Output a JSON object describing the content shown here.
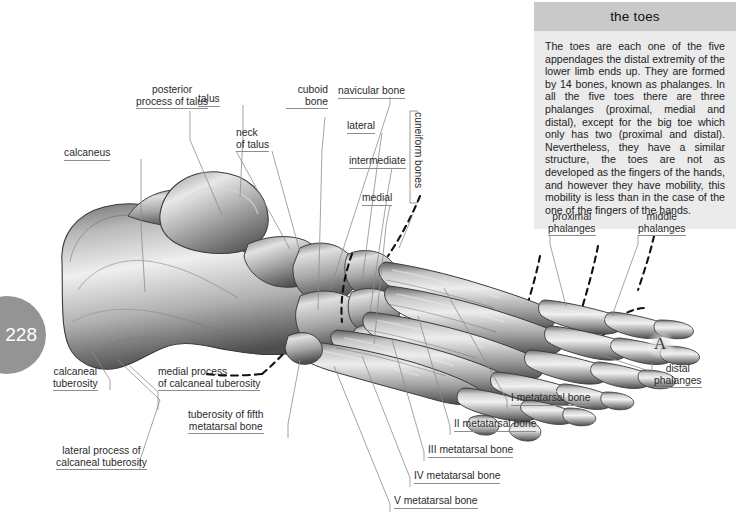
{
  "page": {
    "number": "228",
    "background_color": "#ffffff",
    "badge_color": "#949494"
  },
  "panel": {
    "title": "the toes",
    "title_bg": "#c9c9c9",
    "body_bg": "#ebebeb",
    "body": "The toes are each one of the five appendages the distal extremity of the lower limb ends up. They are formed by 14 bones, known as phalanges. In all the five toes there are three phalanges (proximal, medial and distal), except for the big toe which only has two (proximal and distal). Nevertheless, they have a similar structure, the toes are not as developed as the fingers of the hands, and however they have mobility, this mobility is less than in the case of the one of the fingers of the hands."
  },
  "figure": {
    "marker": "A",
    "bone_fill_light": "#efefef",
    "bone_fill_mid": "#9a9a9a",
    "bone_fill_dark": "#4c4c4c",
    "dashed_boundary_color": "#111111",
    "leader_line_color": "#8d8d8d"
  },
  "labels": [
    {
      "id": "calcaneus",
      "text": "calcaneus"
    },
    {
      "id": "posterior-process-of-talus",
      "text": "posterior\nprocess of talus"
    },
    {
      "id": "talus",
      "text": "talus"
    },
    {
      "id": "neck-of-talus",
      "text": "neck\nof talus"
    },
    {
      "id": "cuboid-bone",
      "text": "cuboid\nbone"
    },
    {
      "id": "navicular-bone",
      "text": "navicular bone"
    },
    {
      "id": "lateral-cuneiform",
      "text": "lateral"
    },
    {
      "id": "intermediate-cuneiform",
      "text": "intermediate"
    },
    {
      "id": "medial-cuneiform",
      "text": "medial"
    },
    {
      "id": "cuneiform-bones",
      "text": "cuneiform bones"
    },
    {
      "id": "proximal-phalanges",
      "text": "proximal\nphalanges"
    },
    {
      "id": "middle-phalanges",
      "text": "middle\nphalanges"
    },
    {
      "id": "distal-phalanges",
      "text": "distal\nphalanges"
    },
    {
      "id": "calcaneal-tuberosity",
      "text": "calcaneal\ntuberosity"
    },
    {
      "id": "medial-process-of-calcaneal-tuberosity",
      "text": "medial process\nof calcaneal tuberosity"
    },
    {
      "id": "lateral-process-of-calcaneal-tuberosity",
      "text": "lateral process of\ncalcaneal tuberosity"
    },
    {
      "id": "tuberosity-of-fifth-metatarsal-bone",
      "text": "tuberosity of fifth\nmetatarsal bone"
    },
    {
      "id": "metatarsal-1",
      "text": "I metatarsal bone"
    },
    {
      "id": "metatarsal-2",
      "text": "II metatarsal bone"
    },
    {
      "id": "metatarsal-3",
      "text": "III metatarsal bone"
    },
    {
      "id": "metatarsal-4",
      "text": "IV metatarsal bone"
    },
    {
      "id": "metatarsal-5",
      "text": "V metatarsal bone"
    }
  ]
}
